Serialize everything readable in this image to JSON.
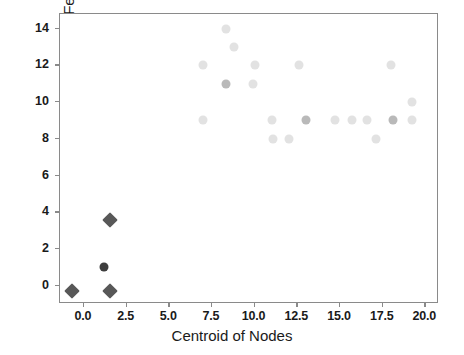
{
  "chart_data": {
    "type": "scatter",
    "title": "",
    "xlabel": "Centroid of Nodes",
    "ylabel": "Centroid of Features",
    "xlim": [
      -1.4,
      20.8
    ],
    "ylim": [
      -1.0,
      14.8
    ],
    "xticks": [
      0.0,
      2.5,
      5.0,
      7.5,
      10.0,
      12.5,
      15.0,
      17.5,
      20.0
    ],
    "xticklabels": [
      "0.0",
      "2.5",
      "5.0",
      "7.5",
      "10.0",
      "12.5",
      "15.0",
      "17.5",
      "20.0"
    ],
    "yticks": [
      0,
      2,
      4,
      6,
      8,
      10,
      12,
      14
    ],
    "yticklabels": [
      "0",
      "2",
      "4",
      "6",
      "8",
      "10",
      "12",
      "14"
    ],
    "grid": false,
    "legend": null,
    "series": [
      {
        "name": "background-points",
        "marker": "circle",
        "color": "#e2e2e2",
        "size": 9,
        "points": [
          {
            "x": 8.3,
            "y": 14.0
          },
          {
            "x": 8.8,
            "y": 13.0
          },
          {
            "x": 7.0,
            "y": 12.0
          },
          {
            "x": 10.0,
            "y": 12.0
          },
          {
            "x": 12.6,
            "y": 12.0
          },
          {
            "x": 18.0,
            "y": 12.0
          },
          {
            "x": 9.9,
            "y": 11.0
          },
          {
            "x": 19.2,
            "y": 10.0
          },
          {
            "x": 7.0,
            "y": 9.0
          },
          {
            "x": 11.0,
            "y": 9.0
          },
          {
            "x": 14.7,
            "y": 9.0
          },
          {
            "x": 15.7,
            "y": 9.0
          },
          {
            "x": 16.6,
            "y": 9.0
          },
          {
            "x": 19.2,
            "y": 9.0
          },
          {
            "x": 11.1,
            "y": 8.0
          },
          {
            "x": 12.0,
            "y": 8.0
          },
          {
            "x": 17.1,
            "y": 8.0
          }
        ]
      },
      {
        "name": "mid-points",
        "marker": "circle",
        "color": "#b9b9b9",
        "size": 9,
        "points": [
          {
            "x": 8.3,
            "y": 11.0
          },
          {
            "x": 13.0,
            "y": 9.0
          },
          {
            "x": 18.1,
            "y": 9.0
          }
        ]
      },
      {
        "name": "centroid-circle",
        "marker": "circle",
        "color": "#3d3d3d",
        "size": 9,
        "points": [
          {
            "x": 1.2,
            "y": 1.0
          }
        ]
      },
      {
        "name": "centroid-diamonds",
        "marker": "diamond",
        "color": "#585858",
        "size": 11,
        "points": [
          {
            "x": -0.7,
            "y": -0.3
          },
          {
            "x": 1.5,
            "y": -0.3
          },
          {
            "x": 1.5,
            "y": 3.6
          }
        ]
      }
    ]
  },
  "axes": {
    "frame_color": "#8a8a8a",
    "tick_color": "#8a8a8a",
    "label_color": "#1a1a1a"
  }
}
